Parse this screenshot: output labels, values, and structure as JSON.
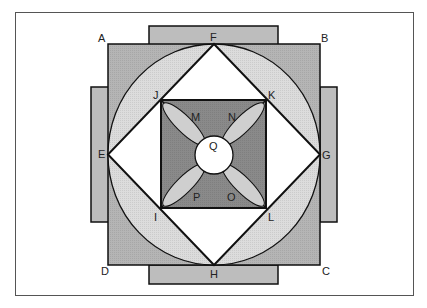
{
  "diagram": {
    "colors": {
      "frame": "#555555",
      "outer_square": "#b5b5b5",
      "tabs": "#bdbdbd",
      "circle": "#dcdcdc",
      "inner_diamond": "#ffffff",
      "inner_square": "#8a8a8a",
      "petals": "#cfcfcf",
      "center_circle": "#ffffff",
      "stroke": "#111111"
    },
    "labels": {
      "A": "A",
      "B": "B",
      "C": "C",
      "D": "D",
      "E": "E",
      "F": "F",
      "G": "G",
      "H": "H",
      "I": "I",
      "J": "J",
      "K": "K",
      "L": "L",
      "M": "M",
      "N": "N",
      "O": "O",
      "P": "P",
      "Q": "Q"
    }
  }
}
